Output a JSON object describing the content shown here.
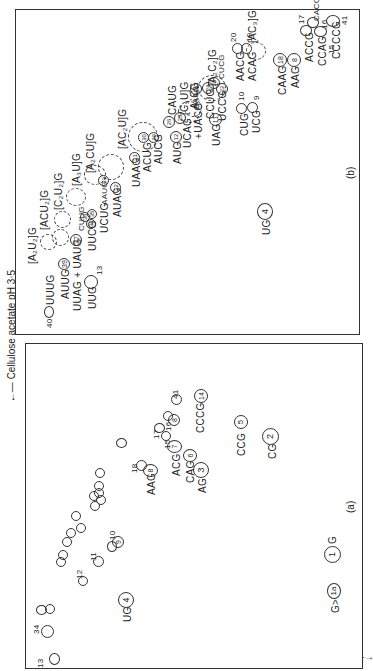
{
  "figure": {
    "axis_top": "←— Cellulose acetate pH 3·5",
    "axis_left": "DEAE–paper pH 1·9 —→",
    "panel_a_caption": "(a)",
    "panel_b_caption": "(b)"
  },
  "panel_a": {
    "labels": {
      "n13": "13",
      "n34": "34",
      "n12": "12",
      "n11": "11",
      "n10": "10",
      "n9": "9",
      "ug4_text": "UG",
      "ug4_num": "4",
      "n18": "18",
      "aag8_text": "AAG",
      "aag8_num": "8",
      "n17": "17",
      "n16": "16",
      "n15": "15",
      "n41": "41",
      "b8": "8",
      "acg7_text": "ACG",
      "acg7_num": "7",
      "cag6_text": "CAG",
      "cag6_num": "6",
      "ag3_text": "AG",
      "ag3_num": "3",
      "cccg14_text": "CCCG",
      "cccg14_num": "14",
      "ccg5_text": "CCG",
      "ccg5_num": "5",
      "cg2_text": "CG",
      "cg2_num": "2",
      "g1_text": "G",
      "g1_num": "1",
      "g1a_text": "G>",
      "g1a_num": "1a"
    }
  },
  "panel_b": {
    "labels": {
      "uuug": "UUUG",
      "n40": "40",
      "auug": "AUUG",
      "n39": "39",
      "uuag_uaug": "UUAG + UAUG",
      "n37": "37",
      "uug13": "UUG",
      "n13": "13",
      "a2u2g": "[A₂U₂]G",
      "acu2g": "[ACU₂]G",
      "c2u2g": "[C₂U₂]G",
      "a3ug": "[A₃U]G",
      "a2cug": "[A₂CU]G",
      "ac2ug": "[AC₂U]G",
      "a3cg": "A₃CG",
      "a2c2g": "[A₂C₂]G",
      "ac3g": "[AC₃]G",
      "cuug": "CUUG",
      "uucg": "UUCG",
      "n34": "34",
      "n36": "36",
      "n35": "35",
      "ucug": "UCUG",
      "aaug": "AAUG",
      "n33": "33",
      "auag": "AUAG",
      "n32": "32",
      "uaag": "UAAG",
      "n31": "31",
      "acug": "ACUG",
      "n30": "30",
      "aucg": "AUCG",
      "n29": "29",
      "aug": "AUG",
      "n12": "12",
      "ucag": "UCAG",
      "n25": "25",
      "uacg": "+UACG",
      "caug": "CAUG",
      "n26": "26",
      "c3ug": "[C₃U]G",
      "aaag": "AAAG",
      "n21": "21",
      "ccug": "CCUG",
      "n24": "24",
      "n23": "23",
      "uccg": "UCCG",
      "n22": "22",
      "cucg": "CUCG",
      "uag": "UAG",
      "n11": "11",
      "cug": "CUG",
      "n10": "10",
      "ucg": "UCG",
      "n9": "9",
      "aacg": "AACG",
      "n20": "20",
      "acag": "ACAG",
      "n19": "19",
      "caag": "CAAG",
      "n18": "18",
      "aag": "AAG",
      "n8": "8",
      "ug": "UG",
      "n4": "4",
      "accg": "ACCG",
      "n17": "17",
      "ccag": "CCAG",
      "n15": "15",
      "cacg": "CACG",
      "n16": "16",
      "ccccg": "CCCCG",
      "n41": "41"
    }
  }
}
